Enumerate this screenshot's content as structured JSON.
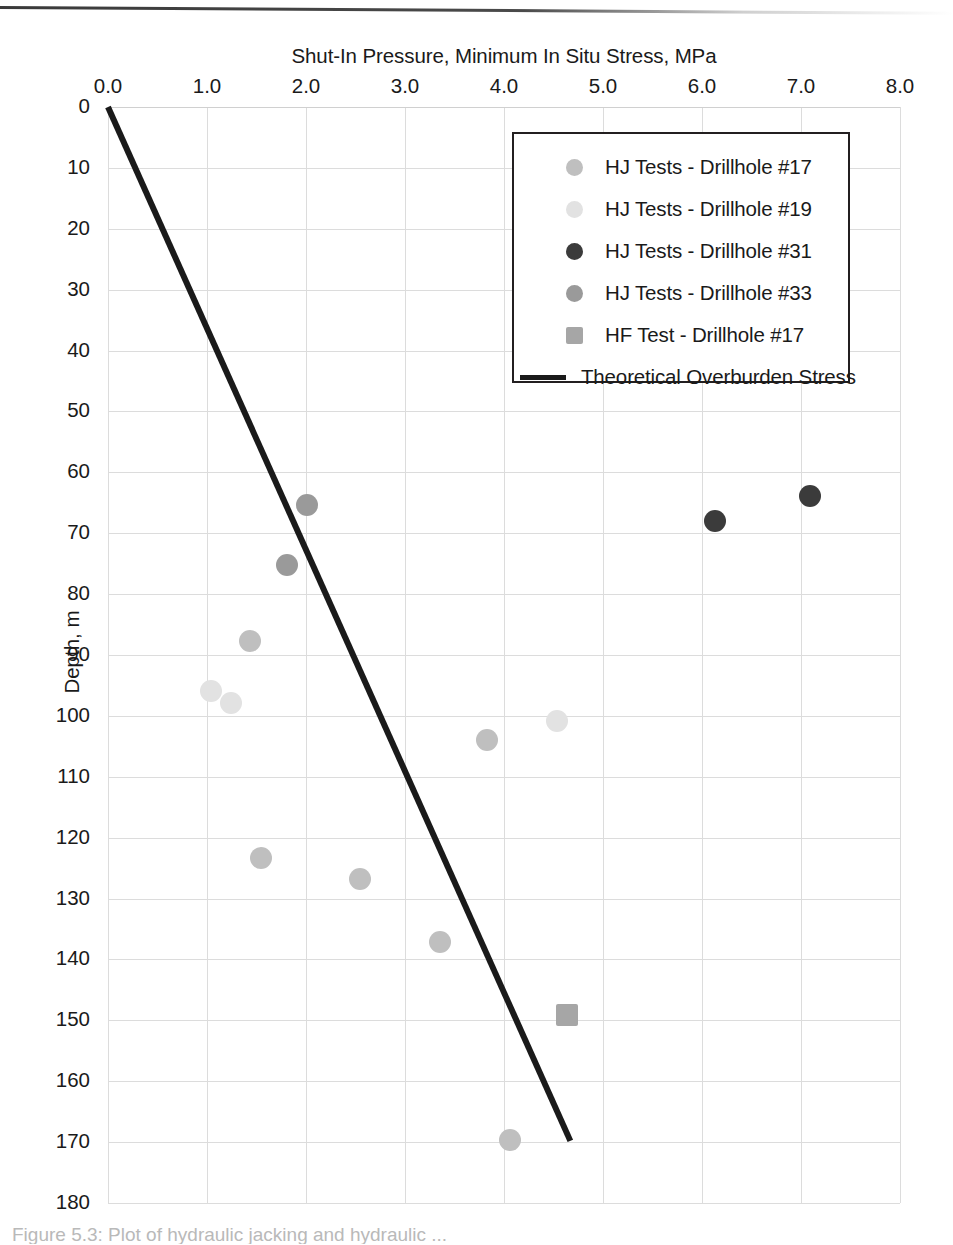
{
  "figure": {
    "bottom_caption": "Figure 5.3:  Plot of hydraulic jacking and hydraulic ..."
  },
  "chart_data": {
    "type": "scatter",
    "title": "",
    "xlabel": "Shut-In Pressure, Minimum In Situ Stress, MPa",
    "ylabel": "Depth, m",
    "xlim": [
      0,
      8
    ],
    "ylim": [
      0,
      180
    ],
    "y_inverted": true,
    "grid": true,
    "legend_position": "top-right-inside",
    "x_ticks": [
      "0.0",
      "1.0",
      "2.0",
      "3.0",
      "4.0",
      "5.0",
      "6.0",
      "7.0",
      "8.0"
    ],
    "y_ticks": [
      "0",
      "10",
      "20",
      "30",
      "40",
      "50",
      "60",
      "70",
      "80",
      "90",
      "100",
      "110",
      "120",
      "130",
      "140",
      "150",
      "160",
      "170",
      "180"
    ],
    "series": [
      {
        "name": "HJ Tests - Drillhole #17",
        "marker": "circle",
        "color": "#bfbfbf",
        "points": [
          {
            "x": 1.43,
            "y": 87.7
          },
          {
            "x": 3.83,
            "y": 103.9
          },
          {
            "x": 1.55,
            "y": 123.3
          },
          {
            "x": 2.55,
            "y": 126.8
          },
          {
            "x": 3.35,
            "y": 137.1
          },
          {
            "x": 4.06,
            "y": 169.6
          }
        ]
      },
      {
        "name": "HJ Tests - Drillhole #19",
        "marker": "circle",
        "color": "#e2e2e2",
        "points": [
          {
            "x": 1.04,
            "y": 95.9
          },
          {
            "x": 1.24,
            "y": 97.9
          },
          {
            "x": 4.54,
            "y": 100.8
          }
        ]
      },
      {
        "name": "HJ Tests - Drillhole #31",
        "marker": "circle",
        "color": "#3b3b3b",
        "points": [
          {
            "x": 6.13,
            "y": 68.0
          },
          {
            "x": 7.09,
            "y": 63.9
          }
        ]
      },
      {
        "name": "HJ Tests - Drillhole #33",
        "marker": "circle",
        "color": "#9a9a9a",
        "points": [
          {
            "x": 2.01,
            "y": 65.4
          },
          {
            "x": 1.81,
            "y": 75.2
          }
        ]
      },
      {
        "name": "HF Test - Drillhole #17",
        "marker": "square",
        "color": "#a6a6a6",
        "points": [
          {
            "x": 4.64,
            "y": 149.1
          }
        ]
      }
    ],
    "lines": [
      {
        "name": "Theoretical Overburden Stress",
        "color": "#1a1a1a",
        "width": 6,
        "points": [
          {
            "x": 0.0,
            "y": 0.0
          },
          {
            "x": 4.67,
            "y": 169.8
          }
        ]
      }
    ]
  },
  "legend": {
    "entries": [
      {
        "label": "HJ Tests - Drillhole #17",
        "marker": "circle",
        "color": "#bfbfbf"
      },
      {
        "label": "HJ Tests - Drillhole #19",
        "marker": "circle",
        "color": "#e2e2e2"
      },
      {
        "label": "HJ Tests - Drillhole #31",
        "marker": "circle",
        "color": "#3b3b3b"
      },
      {
        "label": "HJ Tests - Drillhole #33",
        "marker": "circle",
        "color": "#9a9a9a"
      },
      {
        "label": "HF Test - Drillhole #17",
        "marker": "square",
        "color": "#a6a6a6"
      },
      {
        "label": "Theoretical Overburden Stress",
        "marker": "line",
        "color": "#1a1a1a"
      }
    ]
  }
}
